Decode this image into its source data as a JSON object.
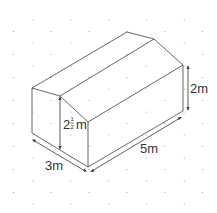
{
  "diagram": {
    "type": "isometric-drawing",
    "labels": {
      "width": "3m",
      "length": "5m",
      "wall_height": "2m",
      "peak_height_whole": "2",
      "peak_height_num": "1",
      "peak_height_den": "2",
      "peak_height_unit": "m"
    },
    "colors": {
      "line": "#555555",
      "dot": "#9a9a9a",
      "text": "#333333",
      "background": "#ffffff"
    }
  }
}
